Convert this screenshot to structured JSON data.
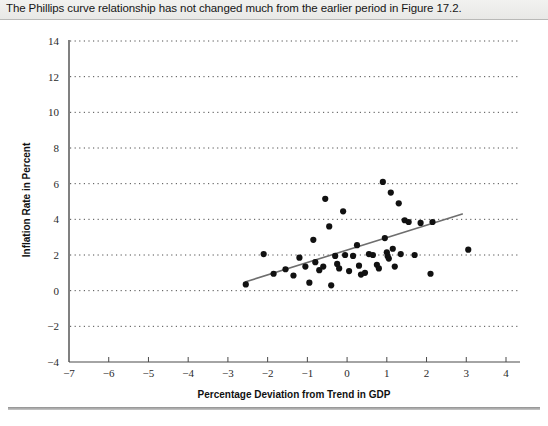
{
  "caption": {
    "text": "The Phillips curve relationship has not changed much from the earlier period in Figure 17.2."
  },
  "chart_data": {
    "type": "scatter",
    "title": "",
    "xlabel": "Percentage Deviation from Trend in GDP",
    "ylabel": "Inflation Rate in Percent",
    "xlim": [
      -7,
      4
    ],
    "ylim": [
      -4,
      14
    ],
    "xticks": [
      -7,
      -6,
      -5,
      -4,
      -3,
      -2,
      -1,
      0,
      1,
      2,
      3,
      4
    ],
    "xtick_labels": [
      "−7",
      "−6",
      "−5",
      "−4",
      "−3",
      "−2",
      "−1",
      "0",
      "1",
      "2",
      "3",
      "4"
    ],
    "yticks": [
      -4,
      -2,
      0,
      2,
      4,
      6,
      8,
      10,
      12,
      14
    ],
    "ytick_labels": [
      "−4",
      "−2",
      "0",
      "2",
      "4",
      "6",
      "8",
      "10",
      "12",
      "14"
    ],
    "grid": "horizontal-dotted",
    "legend": "none",
    "point_color": "#111111",
    "line_color": "#6e6e6e",
    "points": [
      [
        -2.55,
        0.35
      ],
      [
        -2.1,
        2.05
      ],
      [
        -1.85,
        0.95
      ],
      [
        -1.55,
        1.2
      ],
      [
        -1.35,
        0.85
      ],
      [
        -1.2,
        1.85
      ],
      [
        -1.05,
        1.35
      ],
      [
        -0.95,
        0.45
      ],
      [
        -0.85,
        2.85
      ],
      [
        -0.8,
        1.6
      ],
      [
        -0.7,
        1.15
      ],
      [
        -0.6,
        1.35
      ],
      [
        -0.55,
        5.15
      ],
      [
        -0.45,
        3.6
      ],
      [
        -0.4,
        0.3
      ],
      [
        -0.3,
        1.95
      ],
      [
        -0.25,
        1.5
      ],
      [
        -0.2,
        1.25
      ],
      [
        -0.1,
        4.45
      ],
      [
        -0.05,
        2.0
      ],
      [
        0.05,
        1.1
      ],
      [
        0.15,
        1.95
      ],
      [
        0.25,
        2.55
      ],
      [
        0.3,
        1.4
      ],
      [
        0.35,
        0.9
      ],
      [
        0.45,
        1.0
      ],
      [
        0.55,
        2.05
      ],
      [
        0.65,
        2.0
      ],
      [
        0.75,
        1.45
      ],
      [
        0.8,
        1.25
      ],
      [
        0.9,
        6.1
      ],
      [
        0.95,
        2.95
      ],
      [
        1.0,
        2.15
      ],
      [
        1.02,
        1.95
      ],
      [
        1.05,
        1.8
      ],
      [
        1.1,
        5.5
      ],
      [
        1.15,
        2.35
      ],
      [
        1.2,
        1.35
      ],
      [
        1.3,
        4.9
      ],
      [
        1.35,
        2.05
      ],
      [
        1.45,
        3.95
      ],
      [
        1.55,
        3.85
      ],
      [
        1.7,
        2.0
      ],
      [
        1.85,
        3.8
      ],
      [
        2.1,
        0.95
      ],
      [
        2.15,
        3.85
      ],
      [
        3.05,
        2.3
      ]
    ],
    "trend_line": {
      "x0": -2.55,
      "y0": 0.5,
      "x1": 2.9,
      "y1": 4.3
    }
  }
}
